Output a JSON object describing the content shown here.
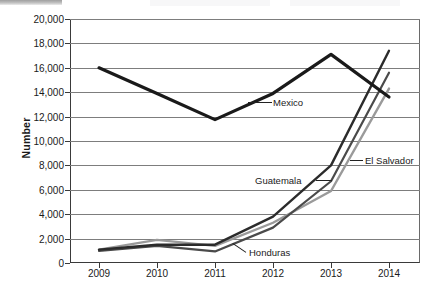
{
  "chart_data": {
    "type": "line",
    "title": "",
    "xlabel": "",
    "ylabel": "Number",
    "x": [
      2009,
      2010,
      2011,
      2012,
      2013,
      2014
    ],
    "categories": [
      "2009",
      "2010",
      "2011",
      "2012",
      "2013",
      "2014"
    ],
    "ylim": [
      0,
      20000
    ],
    "ytick_step": 2000,
    "yticks": [
      0,
      2000,
      4000,
      6000,
      8000,
      10000,
      12000,
      14000,
      16000,
      18000,
      20000
    ],
    "ytick_labels": [
      "0",
      "2,000",
      "4,000",
      "6,000",
      "8,000",
      "10,000",
      "12,000",
      "14,000",
      "16,000",
      "18,000",
      "20,000"
    ],
    "grid": true,
    "legend_position": "inline-callouts",
    "series": [
      {
        "name": "Mexico",
        "color": "#1a1a1a",
        "width": 3.2,
        "values": [
          16000,
          13900,
          11750,
          13900,
          17100,
          13600
        ]
      },
      {
        "name": "Guatemala",
        "color": "#2b2b2b",
        "width": 2.4,
        "values": [
          1100,
          1500,
          1500,
          3800,
          8000,
          17400
        ]
      },
      {
        "name": "Honduras",
        "color": "#4a4a4a",
        "width": 2.2,
        "values": [
          1000,
          1400,
          950,
          2900,
          6700,
          15600
        ]
      },
      {
        "name": "El Salvador",
        "color": "#9a9a9a",
        "width": 2.4,
        "values": [
          1100,
          1900,
          1400,
          3300,
          5900,
          14300
        ]
      }
    ],
    "annotations": [
      {
        "label": "Mexico",
        "series": "Mexico"
      },
      {
        "label": "El Salvador",
        "series": "El Salvador"
      },
      {
        "label": "Guatemala",
        "series": "Guatemala"
      },
      {
        "label": "Honduras",
        "series": "Honduras"
      }
    ]
  }
}
